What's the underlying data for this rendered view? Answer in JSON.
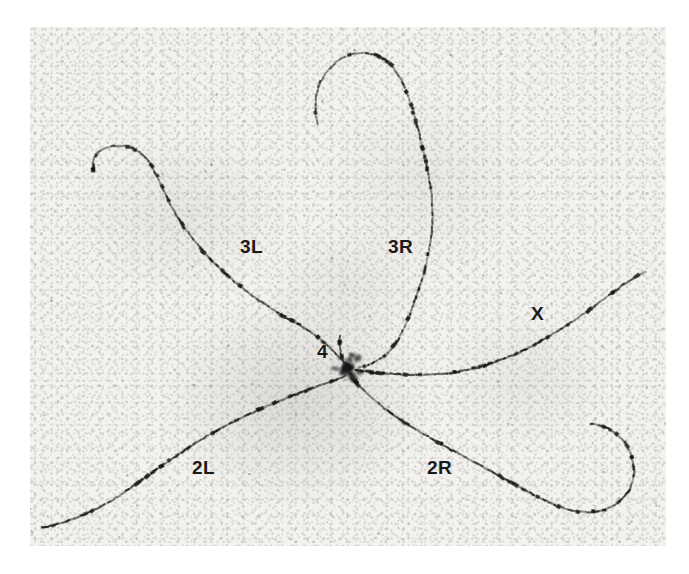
{
  "figure": {
    "kind": "photomicrograph",
    "background_color": "#f3f2ef",
    "print_color": "#ffffff",
    "band_color": "#141414",
    "strand_color": "#6e6c68",
    "label_color": "#1a1a1a"
  },
  "labels": [
    {
      "id": "3L",
      "text": "3L",
      "x": 240,
      "y": 236,
      "size": 19
    },
    {
      "id": "3R",
      "text": "3R",
      "x": 388,
      "y": 236,
      "size": 19
    },
    {
      "id": "X",
      "text": "X",
      "x": 531,
      "y": 303,
      "size": 19
    },
    {
      "id": "4",
      "text": "4",
      "x": 317,
      "y": 341,
      "size": 19
    },
    {
      "id": "2L",
      "text": "2L",
      "x": 192,
      "y": 457,
      "size": 19
    },
    {
      "id": "2R",
      "text": "2R",
      "x": 427,
      "y": 457,
      "size": 19
    }
  ],
  "chromocenter": {
    "x": 347,
    "y": 367,
    "radius": 14
  },
  "arms": [
    {
      "id": "3R",
      "name": "chromosome-arm-3R",
      "band_count": 104,
      "path": "M 318 124 C 312 104, 316 80, 334 64 C 352 48, 378 50, 392 66 C 404 80, 410 100, 416 122 C 424 152, 430 178, 432 200 C 434 226, 430 250, 424 272 C 416 300, 408 322, 398 340 C 388 356, 374 364, 358 368"
    },
    {
      "id": "3L",
      "name": "chromosome-arm-3L",
      "band_count": 96,
      "path": "M 94 172 C 90 158, 98 148, 114 146 C 132 144, 146 154, 154 170 C 162 186, 168 202, 178 218 C 192 240, 208 258, 226 274 C 248 294, 272 310, 294 322 C 312 332, 326 342, 336 354 C 342 360, 346 364, 350 368"
    },
    {
      "id": "X",
      "name": "chromosome-arm-X",
      "band_count": 92,
      "path": "M 356 370 C 382 374, 410 376, 438 374 C 470 372, 500 362, 528 348 C 556 334, 584 314, 608 296 C 624 284, 636 276, 646 272"
    },
    {
      "id": "2L",
      "name": "chromosome-arm-2L",
      "band_count": 100,
      "path": "M 346 376 C 330 382, 312 388, 292 396 C 266 406, 240 418, 214 432 C 186 448, 156 470, 128 490 C 102 508, 72 522, 42 528"
    },
    {
      "id": "2R",
      "name": "chromosome-arm-2R",
      "band_count": 106,
      "path": "M 352 378 C 364 392, 380 406, 398 418 C 422 434, 448 448, 474 462 C 500 476, 524 490, 548 502 C 572 514, 598 516, 616 504 C 634 492, 638 470, 630 452 C 622 434, 606 424, 590 424"
    },
    {
      "id": "4",
      "name": "chromosome-4",
      "band_count": 12,
      "path": "M 340 336 C 339 344, 340 352, 343 360"
    }
  ],
  "caption": ""
}
